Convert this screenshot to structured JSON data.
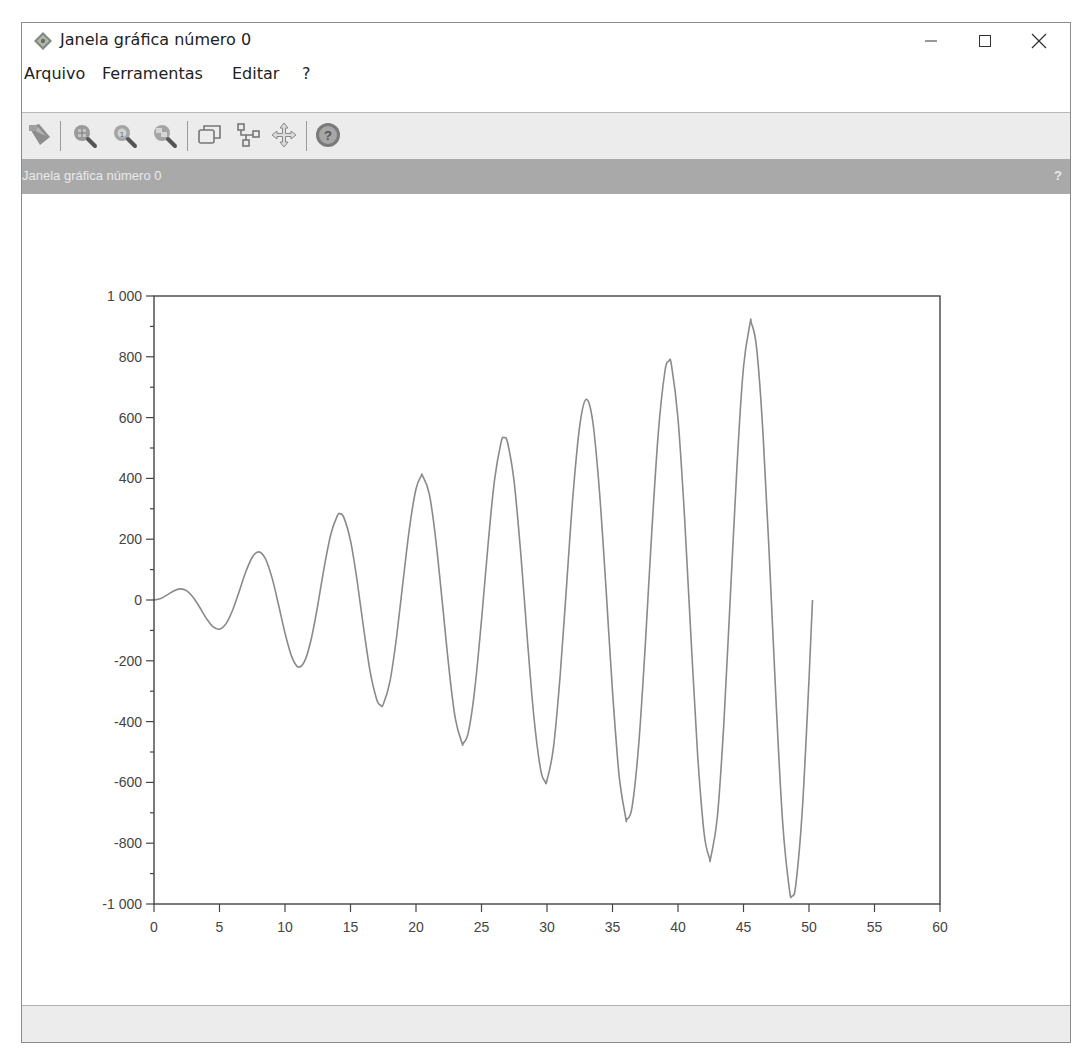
{
  "window": {
    "title": "Janela gráfica número 0",
    "controls": {
      "minimize": "minimize",
      "maximize": "maximize",
      "close": "close"
    }
  },
  "menubar": {
    "items": [
      {
        "label": "Arquivo"
      },
      {
        "label": "Ferramentas"
      },
      {
        "label": "Editar"
      },
      {
        "label": "?"
      }
    ]
  },
  "toolbar": {
    "buttons": [
      {
        "icon": "datatip-icon",
        "tooltip": ""
      },
      {
        "icon": "zoom-in-icon"
      },
      {
        "icon": "zoom-original-icon"
      },
      {
        "icon": "zoom-fit-icon"
      },
      {
        "icon": "windows-icon"
      },
      {
        "icon": "tree-icon"
      },
      {
        "icon": "pan-move-icon"
      },
      {
        "icon": "help-icon"
      }
    ]
  },
  "dock": {
    "title": "Janela gráfica número 0",
    "help": "?"
  },
  "colors": {
    "curve": "#8a8a8a",
    "axis": "#444444",
    "dock_header": "#a9a9a9",
    "toolbar": "#ececec"
  },
  "chart_data": {
    "type": "line",
    "title": "",
    "xlabel": "",
    "ylabel": "",
    "xlim": [
      0,
      60
    ],
    "ylim": [
      -1000,
      1000
    ],
    "grid": false,
    "legend": null,
    "xticks": [
      0,
      5,
      10,
      15,
      20,
      25,
      30,
      35,
      40,
      45,
      50,
      55,
      60
    ],
    "xtick_labels": [
      "0",
      "5",
      "10",
      "15",
      "20",
      "25",
      "30",
      "35",
      "40",
      "45",
      "50",
      "55",
      "60"
    ],
    "yticks": [
      1000,
      800,
      600,
      400,
      200,
      0,
      -200,
      -400,
      -600,
      -800,
      -1000
    ],
    "ytick_labels": [
      "1 000",
      "800",
      "600",
      "400",
      "200",
      "0",
      "-200",
      "-400",
      "-600",
      "-800",
      "-1 000"
    ],
    "series": [
      {
        "name": "y = 20·x·sin(x)",
        "x": [
          0,
          0.5,
          1,
          1.5,
          2,
          2.5,
          3,
          3.5,
          4,
          4.5,
          5,
          5.5,
          6,
          6.5,
          7,
          7.5,
          8,
          8.5,
          9,
          9.5,
          10,
          10.5,
          11,
          11.5,
          12,
          12.5,
          13,
          13.5,
          14,
          14.2,
          14.5,
          15,
          15.5,
          16,
          16.5,
          17,
          17.3,
          17.5,
          18,
          18.5,
          19,
          19.5,
          20,
          20.4,
          20.5,
          21,
          21.5,
          22,
          22.5,
          23,
          23.5,
          23.6,
          24,
          24.5,
          25,
          25.5,
          26,
          26.5,
          26.7,
          27,
          27.5,
          28,
          28.5,
          29,
          29.5,
          29.85,
          30,
          30.5,
          31,
          31.5,
          32,
          32.5,
          33,
          33.5,
          34,
          34.5,
          35,
          35.5,
          36,
          36.1,
          36.5,
          37,
          37.5,
          38,
          38.5,
          39,
          39.3,
          39.5,
          40,
          40.5,
          41,
          41.5,
          42,
          42.4,
          42.5,
          43,
          43.5,
          44,
          44.5,
          45,
          45.5,
          45.6,
          46,
          46.5,
          47,
          47.5,
          48,
          48.5,
          48.7,
          49,
          49.5,
          50,
          50.27
        ],
        "y": [
          0,
          4.79,
          16.83,
          29.92,
          36.37,
          29.92,
          8.47,
          -24.56,
          -60.54,
          -87.98,
          -95.89,
          -77.61,
          -33.53,
          27.96,
          91.98,
          140.7,
          158.3,
          135.7,
          74.18,
          -14.29,
          -108.8,
          -184.7,
          -220.0,
          -201.4,
          -128.8,
          -16.58,
          109.3,
          217.0,
          277.4,
          283.4,
          271.1,
          195.1,
          64.02,
          -92.13,
          -234.9,
          -326.9,
          -345.9,
          -343.2,
          -270.4,
          -126.7,
          56.96,
          236.1,
          365.2,
          407.9,
          408.7,
          351.4,
          202.8,
          -3.92,
          -219.2,
          -389.3,
          -469.3,
          -471.8,
          -434.7,
          -289.3,
          -66.18,
          183.1,
          396.6,
          519.1,
          534.0,
          516.5,
          384.6,
          151.7,
          -127.5,
          -384.9,
          -555.2,
          -597.0,
          -592.8,
          -484.0,
          -250.5,
          52.98,
          352.9,
          574.2,
          659.9,
          584.0,
          359.8,
          39.68,
          -299.7,
          -574.4,
          -714.1,
          -721.6,
          -680.4,
          -476.2,
          -148.4,
          225.3,
          552.9,
          751.8,
          785.6,
          772.5,
          596.1,
          270.6,
          -130.1,
          -508.3,
          -769.9,
          -848.0,
          -846.4,
          -715.3,
          -403.4,
          15.58,
          440.6,
          765.8,
          909.0,
          911.0,
          829.6,
          541.4,
          116.2,
          -348.9,
          -737.6,
          -951.8,
          -974.0,
          -934.6,
          -686.0,
          -262.4,
          0
        ]
      }
    ]
  }
}
